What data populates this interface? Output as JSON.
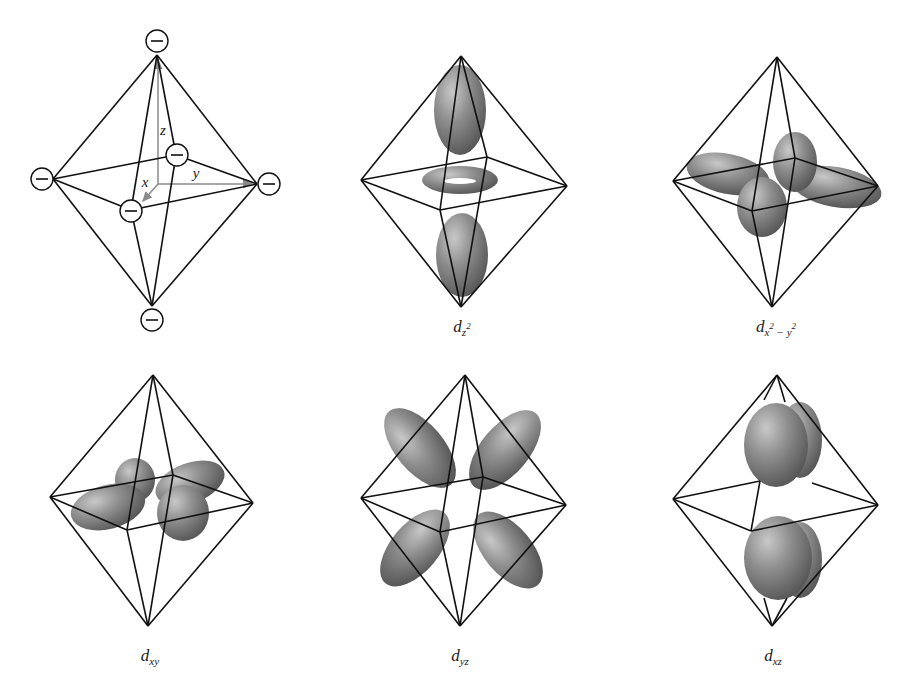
{
  "figure": {
    "panels": [
      {
        "id": "ligand-field",
        "label": null,
        "axes": {
          "x": "x",
          "y": "y",
          "z": "z"
        },
        "ligand_charge": "−",
        "ligand_count": 6
      },
      {
        "id": "dz2",
        "label": {
          "main": "d",
          "sub": "z",
          "sup": "2"
        }
      },
      {
        "id": "dx2y2",
        "label": {
          "main": "d",
          "sub": "x",
          "sup1": "2",
          "minus": " − ",
          "sub2": "y",
          "sup2": "2"
        }
      },
      {
        "id": "dxy",
        "label": {
          "main": "d",
          "sub": "xy"
        }
      },
      {
        "id": "dyz",
        "label": {
          "main": "d",
          "sub": "yz"
        }
      },
      {
        "id": "dxz",
        "label": {
          "main": "d",
          "sub": "xz"
        }
      }
    ],
    "colors": {
      "line": "#111111",
      "axis": "#8a8a8a",
      "lobe_light": "#b9b9b9",
      "lobe_mid": "#8a8a8a",
      "lobe_dark": "#5a5a5a",
      "background": "#ffffff"
    }
  }
}
